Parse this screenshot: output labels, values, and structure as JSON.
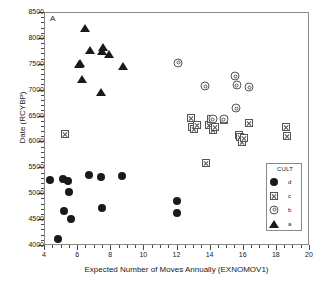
{
  "panel": {
    "label": "A"
  },
  "chart_data": {
    "type": "scatter",
    "title": "",
    "xlabel": "Expected Number of Moves  Annually (EXNOMOV1)",
    "ylabel": "Date (RCYBP)",
    "xlim": [
      4,
      20
    ],
    "ylim": [
      4000,
      8500
    ],
    "xticks": [
      4,
      6,
      8,
      10,
      12,
      14,
      16,
      18,
      20
    ],
    "yticks": [
      4000,
      4500,
      5000,
      5500,
      6000,
      6500,
      7000,
      7500,
      8000,
      8500
    ],
    "xtick_step_minor": 0.5,
    "ytick_step_minor": 100,
    "grid": false,
    "legend_title": "CULT",
    "legend_position": "lower-right-inside",
    "series": [
      {
        "name": "d",
        "marker": "filled-circle",
        "color": "#1a1a1a",
        "points": [
          [
            4.35,
            5255
          ],
          [
            4.85,
            4120
          ],
          [
            5.15,
            5270
          ],
          [
            5.2,
            4650
          ],
          [
            5.45,
            5230
          ],
          [
            5.5,
            5015
          ],
          [
            5.6,
            4495
          ],
          [
            6.7,
            5345
          ],
          [
            7.45,
            5305
          ],
          [
            7.5,
            4710
          ],
          [
            8.7,
            5325
          ],
          [
            12.0,
            4855
          ],
          [
            12.05,
            4610
          ]
        ]
      },
      {
        "name": "c",
        "marker": "square-x",
        "color": "#555555",
        "points": [
          [
            5.25,
            6135
          ],
          [
            12.85,
            6445
          ],
          [
            12.95,
            6275
          ],
          [
            13.05,
            6250
          ],
          [
            13.25,
            6310
          ],
          [
            13.8,
            5575
          ],
          [
            13.95,
            6315
          ],
          [
            14.1,
            6435
          ],
          [
            14.2,
            6220
          ],
          [
            14.3,
            6270
          ],
          [
            14.85,
            6410
          ],
          [
            15.75,
            6130
          ],
          [
            15.85,
            6090
          ],
          [
            15.95,
            5980
          ],
          [
            16.05,
            6070
          ],
          [
            16.4,
            6355
          ],
          [
            18.6,
            6285
          ],
          [
            18.65,
            6105
          ]
        ]
      },
      {
        "name": "b",
        "marker": "concentric-circle",
        "color": "#555555",
        "points": [
          [
            12.1,
            7520
          ],
          [
            13.75,
            7065
          ],
          [
            14.2,
            6430
          ],
          [
            14.85,
            6430
          ],
          [
            15.55,
            7255
          ],
          [
            15.6,
            6640
          ],
          [
            15.65,
            7085
          ],
          [
            16.4,
            7050
          ]
        ]
      },
      {
        "name": "a",
        "marker": "filled-triangle",
        "color": "#1a1a1a",
        "points": [
          [
            6.1,
            7505
          ],
          [
            6.2,
            7515
          ],
          [
            6.3,
            7215
          ],
          [
            6.5,
            8200
          ],
          [
            6.75,
            7775
          ],
          [
            7.45,
            6960
          ],
          [
            7.5,
            7745
          ],
          [
            7.55,
            7815
          ],
          [
            7.9,
            7695
          ],
          [
            8.75,
            7455
          ]
        ]
      }
    ]
  },
  "legend": {
    "title": "CULT",
    "entries": [
      {
        "label": "d",
        "marker": "filled-circle"
      },
      {
        "label": "c",
        "marker": "square-x"
      },
      {
        "label": "b",
        "marker": "concentric-circle"
      },
      {
        "label": "a",
        "marker": "filled-triangle"
      }
    ]
  }
}
